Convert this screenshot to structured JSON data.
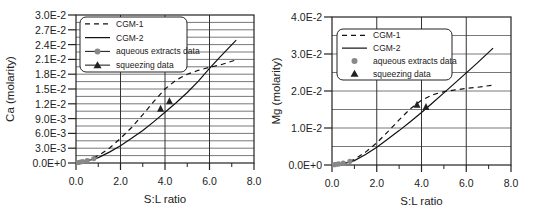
{
  "chart_data": [
    {
      "type": "line",
      "title": "",
      "xlabel": "S:L ratio",
      "ylabel": "Ca (molarity)",
      "xlim": [
        0,
        8
      ],
      "ylim": [
        0,
        0.03
      ],
      "xticks": [
        "0.0",
        "2.0",
        "4.0",
        "6.0",
        "8.0"
      ],
      "yticks": [
        "0.0E+0",
        "3.0E-3",
        "6.0E-3",
        "9.0E-3",
        "1.2E-2",
        "1.5E-2",
        "1.8E-2",
        "2.1E-2",
        "2.4E-2",
        "2.7E-2",
        "3.0E-2"
      ],
      "grid": true,
      "legend_position": "upper left",
      "legend": [
        "CGM-1",
        "CGM-2",
        "aqueous extracts data",
        "squeezing data"
      ],
      "series": [
        {
          "name": "CGM-1",
          "style": "dashed",
          "x": [
            0,
            0.5,
            1.0,
            1.5,
            2.0,
            2.5,
            3.0,
            3.5,
            4.0,
            4.5,
            5.0,
            5.5,
            6.0,
            6.5,
            7.2
          ],
          "y": [
            0,
            0.0006,
            0.0015,
            0.003,
            0.005,
            0.0072,
            0.0098,
            0.0125,
            0.015,
            0.0168,
            0.018,
            0.0188,
            0.0194,
            0.0199,
            0.0209
          ]
        },
        {
          "name": "CGM-2",
          "style": "solid",
          "x": [
            0,
            0.5,
            1.0,
            1.5,
            2.0,
            2.5,
            3.0,
            3.5,
            4.0,
            4.5,
            5.0,
            5.5,
            6.0,
            6.5,
            7.2
          ],
          "y": [
            0,
            0.0004,
            0.0011,
            0.0022,
            0.0035,
            0.005,
            0.0066,
            0.0084,
            0.0103,
            0.0122,
            0.0143,
            0.0166,
            0.0192,
            0.0216,
            0.0249
          ]
        },
        {
          "name": "aqueous extracts data",
          "style": "marker-circle",
          "x": [
            0.1,
            0.2,
            0.3,
            0.5,
            0.8
          ],
          "y": [
            0.0001,
            0.0002,
            0.0003,
            0.0005,
            0.0009
          ]
        },
        {
          "name": "squeezing data",
          "style": "marker-triangle",
          "x": [
            3.8,
            4.2
          ],
          "y": [
            0.011,
            0.0125
          ]
        }
      ]
    },
    {
      "type": "line",
      "title": "",
      "xlabel": "S:L ratio",
      "ylabel": "Mg (molarity)",
      "xlim": [
        0,
        8
      ],
      "ylim": [
        0,
        0.04
      ],
      "xticks": [
        "0.0",
        "2.0",
        "4.0",
        "6.0",
        "8.0"
      ],
      "yticks": [
        "0.0E+0",
        "1.0E-2",
        "2.0E-2",
        "3.0E-2",
        "4.0E-2"
      ],
      "grid": true,
      "legend_position": "upper left",
      "legend": [
        "CGM-1",
        "CGM-2",
        "aqueous extracts data",
        "squeezing data"
      ],
      "series": [
        {
          "name": "CGM-1",
          "style": "dashed",
          "x": [
            0,
            0.5,
            1.0,
            1.5,
            2.0,
            2.5,
            3.0,
            3.5,
            4.0,
            4.5,
            5.0,
            5.5,
            6.0,
            6.5,
            7.2
          ],
          "y": [
            0,
            0.0005,
            0.0015,
            0.0035,
            0.006,
            0.009,
            0.0122,
            0.0152,
            0.0175,
            0.019,
            0.0198,
            0.0203,
            0.0207,
            0.021,
            0.0216
          ]
        },
        {
          "name": "CGM-2",
          "style": "solid",
          "x": [
            0,
            0.5,
            1.0,
            1.5,
            2.0,
            2.5,
            3.0,
            3.5,
            4.0,
            4.5,
            5.0,
            5.5,
            6.0,
            6.5,
            7.2
          ],
          "y": [
            0,
            0.0003,
            0.0012,
            0.0028,
            0.0048,
            0.007,
            0.0093,
            0.0117,
            0.0142,
            0.0168,
            0.0195,
            0.0222,
            0.0249,
            0.0276,
            0.0316
          ]
        },
        {
          "name": "aqueous extracts data",
          "style": "marker-circle",
          "x": [
            0.1,
            0.2,
            0.3,
            0.5,
            0.8
          ],
          "y": [
            0.0001,
            0.0002,
            0.0003,
            0.0005,
            0.001
          ]
        },
        {
          "name": "squeezing data",
          "style": "marker-triangle",
          "x": [
            3.8,
            4.2
          ],
          "y": [
            0.0163,
            0.0157
          ]
        }
      ]
    }
  ]
}
